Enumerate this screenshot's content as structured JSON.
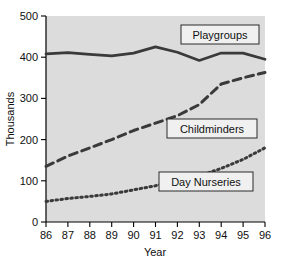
{
  "chart_data": {
    "type": "line",
    "title": "",
    "xlabel": "Year",
    "ylabel": "Thousands",
    "x": [
      "86",
      "87",
      "88",
      "89",
      "90",
      "91",
      "92",
      "93",
      "94",
      "95",
      "96"
    ],
    "xlim": [
      86,
      96
    ],
    "ylim": [
      0,
      500
    ],
    "yticks": [
      "0",
      "100",
      "200",
      "300",
      "400",
      "500"
    ],
    "ytick_values": [
      0,
      100,
      200,
      300,
      400,
      500
    ],
    "grid": false,
    "legend_position": "inline-labels",
    "series": [
      {
        "name": "Playgroups",
        "style": "solid",
        "color": "#3a3a3a",
        "values": [
          408,
          411,
          407,
          403,
          410,
          425,
          412,
          392,
          410,
          410,
          395
        ]
      },
      {
        "name": "Childminders",
        "style": "dashed",
        "color": "#3a3a3a",
        "values": [
          135,
          160,
          180,
          200,
          222,
          240,
          258,
          285,
          335,
          350,
          363
        ]
      },
      {
        "name": "Day Nurseries",
        "style": "dotted",
        "color": "#3a3a3a",
        "values": [
          50,
          57,
          62,
          68,
          78,
          88,
          103,
          112,
          130,
          152,
          180
        ]
      }
    ],
    "annotations": [
      {
        "label": "Playgroups",
        "x": 221,
        "y": 35
      },
      {
        "label": "Childminders",
        "x": 212,
        "y": 129
      },
      {
        "label": "Day Nurseries",
        "x": 206,
        "y": 182
      }
    ]
  },
  "axes": {
    "y_title": "Thousands",
    "x_title": "Year",
    "y_tick_labels": [
      "500",
      "400",
      "300",
      "200",
      "100",
      "0"
    ],
    "x_tick_labels": [
      "86",
      "87",
      "88",
      "89",
      "90",
      "91",
      "92",
      "93",
      "94",
      "95",
      "96"
    ]
  },
  "legend_labels": {
    "playgroups": "Playgroups",
    "childminders": "Childminders",
    "day_nurseries": "Day Nurseries"
  },
  "colors": {
    "plot_background": "#dcdcdc",
    "page_background": "#ffffff",
    "line": "#3a3a3a",
    "axis": "#000000",
    "legend_box_fill": "#f0f0f0"
  }
}
